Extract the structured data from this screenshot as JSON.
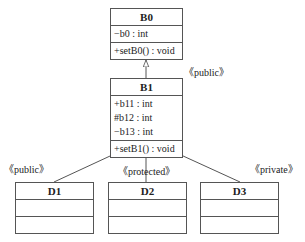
{
  "classes": {
    "B0": {
      "name": "B0",
      "attributes": [
        "−b0 : int"
      ],
      "operations": [
        "+setB0() : void"
      ]
    },
    "B1": {
      "name": "B1",
      "attributes": [
        "+b11 : int",
        "#b12 : int",
        "−b13 : int"
      ],
      "operations": [
        "+setB1() : void"
      ]
    },
    "D1": {
      "name": "D1"
    },
    "D2": {
      "name": "D2"
    },
    "D3": {
      "name": "D3"
    }
  },
  "relations": {
    "b1_b0": {
      "label": "《public》"
    },
    "d1_b1": {
      "label": "《public》"
    },
    "d2_b1": {
      "label": "《protected》"
    },
    "d3_b1": {
      "label": "《private》"
    }
  },
  "colors": {
    "line": "#555555",
    "background": "#ffffff"
  }
}
